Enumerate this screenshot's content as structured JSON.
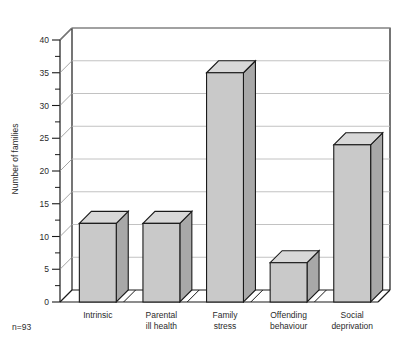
{
  "figure": {
    "background_color": "#ffffff",
    "ink_color": "#1a1a1a",
    "bar_face_color": "#c9c9c9",
    "bar_top_color": "#d8d8d8",
    "bar_side_color": "#a8a8a8",
    "bar_edge_color": "#1a1a1a",
    "gridline_color": "#bbbbbb",
    "floor_color": "#ffffff",
    "footnote": "n=93",
    "faded_header_text": ""
  },
  "chart_data": {
    "type": "bar",
    "title": "",
    "subtitle": "",
    "xlabel": "",
    "ylabel": "Number of families",
    "categories": [
      "Intrinsic",
      "Parental ill health",
      "Family stress",
      "Offending behaviour",
      "Social deprivation"
    ],
    "category_lines": [
      [
        "Intrinsic"
      ],
      [
        "Parental",
        "ill health"
      ],
      [
        "Family",
        "stress"
      ],
      [
        "Offending",
        "behaviour"
      ],
      [
        "Social",
        "deprivation"
      ]
    ],
    "values": [
      12,
      12,
      35,
      6,
      24
    ],
    "ylim": [
      0,
      40
    ],
    "ytick_step": 5,
    "ytick_labels": [
      "0",
      "5",
      "10",
      "15",
      "20",
      "25",
      "30",
      "35",
      "40"
    ],
    "ytick_values": [
      0,
      5,
      10,
      15,
      20,
      25,
      30,
      35,
      40
    ],
    "minor_ticks": true,
    "grid": true,
    "grid_axis": "y",
    "legend": false,
    "legend_position": "none",
    "style": "3d-bars",
    "annotations": [
      "n=93"
    ]
  },
  "axis": {
    "y_title": "Number of families",
    "y_min_label": "0",
    "y_max_label": "40"
  }
}
